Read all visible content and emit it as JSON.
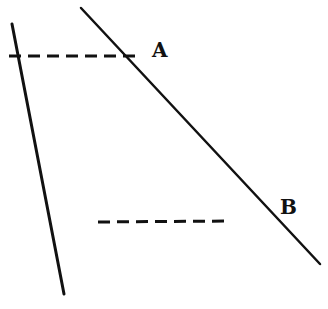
{
  "diagram": {
    "type": "geometry-lines",
    "labels": {
      "a": "A",
      "b": "B"
    },
    "lines": [
      {
        "id": "left-line",
        "style": "solid",
        "x1": 12,
        "y1": 24,
        "x2": 64,
        "y2": 294
      },
      {
        "id": "right-line",
        "style": "solid",
        "x1": 81,
        "y1": 8,
        "x2": 320,
        "y2": 264
      },
      {
        "id": "dashed-segment-a",
        "style": "dashed",
        "x1": 9,
        "y1": 56,
        "x2": 138,
        "y2": 56
      },
      {
        "id": "dashed-segment-b",
        "style": "dashed",
        "x1": 98,
        "y1": 222,
        "x2": 230,
        "y2": 221
      }
    ],
    "colors": {
      "stroke": "#111111",
      "background": "#ffffff"
    }
  }
}
